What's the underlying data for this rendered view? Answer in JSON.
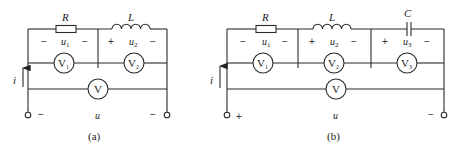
{
  "diagrams": [
    {
      "id": "a",
      "caption": "(a)",
      "components": {
        "R": {
          "label": "R",
          "voltage": "u",
          "sub": "1",
          "left_sign": "−",
          "right_sign": "−"
        },
        "L": {
          "label": "L",
          "voltage": "u",
          "sub": "2",
          "left_sign": "+",
          "right_sign": "−"
        }
      },
      "voltmeters": [
        {
          "label": "V",
          "sub": "1"
        },
        {
          "label": "V",
          "sub": "2"
        },
        {
          "label": "V",
          "sub": ""
        }
      ],
      "current": "i",
      "source_voltage": "u",
      "terminal_left_sign": "−",
      "terminal_right_sign": "−"
    },
    {
      "id": "b",
      "caption": "(b)",
      "components": {
        "R": {
          "label": "R",
          "voltage": "u",
          "sub": "1",
          "left_sign": "−",
          "right_sign": "−"
        },
        "L": {
          "label": "L",
          "voltage": "u",
          "sub": "2",
          "left_sign": "+",
          "right_sign": "−"
        },
        "C": {
          "label": "C",
          "voltage": "u",
          "sub": "3",
          "left_sign": "+",
          "right_sign": "−"
        }
      },
      "voltmeters": [
        {
          "label": "V",
          "sub": "1"
        },
        {
          "label": "V",
          "sub": "2"
        },
        {
          "label": "V",
          "sub": "3"
        },
        {
          "label": "V",
          "sub": ""
        }
      ],
      "current": "i",
      "source_voltage": "u",
      "terminal_left_sign": "+",
      "terminal_right_sign": "−"
    }
  ]
}
